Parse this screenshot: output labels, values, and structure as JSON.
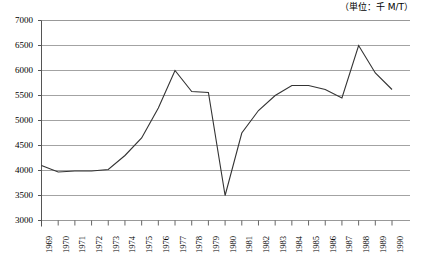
{
  "unit_note": "（単位：千 M/T）",
  "chart_data": {
    "type": "line",
    "title": "",
    "subtitle": "",
    "xlabel": "",
    "ylabel": "",
    "unit": "千 M/T",
    "grid": true,
    "legend": "none",
    "ylim": [
      3000,
      7000
    ],
    "ytick_step": 500,
    "yticks": [
      7000,
      6500,
      6000,
      5500,
      5000,
      4500,
      4000,
      3500,
      3000
    ],
    "ytick_labels": [
      "7000",
      "6500",
      "6000",
      "5500",
      "5000",
      "4500",
      "4000",
      "3500",
      "3000"
    ],
    "categories": [
      "1969",
      "1970",
      "1971",
      "1972",
      "1973",
      "1974",
      "1975",
      "1976",
      "1977",
      "1978",
      "1979",
      "1980",
      "1981",
      "1982",
      "1983",
      "1984",
      "1985",
      "1986",
      "1987",
      "1988",
      "1989",
      "1990"
    ],
    "values": [
      4100,
      3970,
      3990,
      3990,
      4020,
      4300,
      4650,
      5250,
      6000,
      5580,
      5560,
      3500,
      4750,
      5200,
      5500,
      5700,
      5700,
      5620,
      5450,
      6500,
      5950,
      5620
    ],
    "line_color": "#333333",
    "grid_color": "#999999",
    "axis_color": "#555555"
  }
}
